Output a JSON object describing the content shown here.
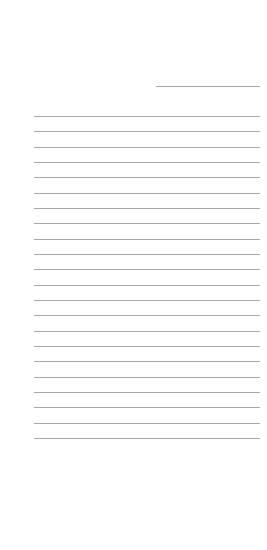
{
  "page": {
    "type": "lined-paper",
    "background": "#ffffff",
    "line_color": "#9a9a9a",
    "header_line": {
      "x": 156,
      "y": 86,
      "width": 104
    },
    "rules": {
      "count": 22,
      "start_y": 116,
      "spacing": 15.33,
      "x": 34,
      "width": 226
    }
  }
}
